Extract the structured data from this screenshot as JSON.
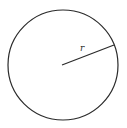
{
  "diagram": {
    "type": "circle-with-radius",
    "circle": {
      "cx": 63,
      "cy": 65,
      "r": 55,
      "stroke": "#2a2a2a"
    },
    "radius_line": {
      "x1": 62,
      "y1": 65,
      "x2": 114,
      "y2": 45,
      "stroke": "#2a2a2a"
    },
    "radius_label": "r"
  }
}
